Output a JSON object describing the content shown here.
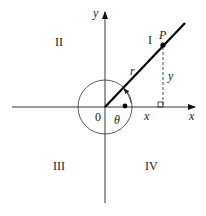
{
  "diagram": {
    "axes": {
      "x_label": "x",
      "y_label": "y",
      "origin_label": "0"
    },
    "quadrants": {
      "q1": "I",
      "q2": "II",
      "q3": "III",
      "q4": "IV"
    },
    "point": {
      "label": "P"
    },
    "segments": {
      "radius_label": "r",
      "x_label": "x",
      "y_label": "y"
    },
    "angle": {
      "label": "θ"
    },
    "colors": {
      "stroke": "#111111",
      "background": "#ffffff"
    }
  }
}
